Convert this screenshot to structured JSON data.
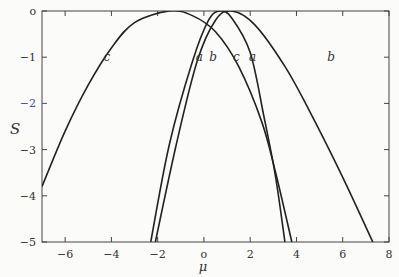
{
  "chart_data": {
    "type": "line",
    "title": "",
    "xlabel": "μ",
    "ylabel": "S",
    "xlim": [
      -7,
      8
    ],
    "ylim": [
      -5,
      0
    ],
    "x_ticks": [
      -6,
      -4,
      -2,
      0,
      2,
      4,
      6,
      8
    ],
    "x_tick_labels": [
      "−6",
      "−4",
      "−2",
      "o",
      "2",
      "4",
      "6",
      "8"
    ],
    "y_ticks": [
      0,
      -1,
      -2,
      -3,
      -4,
      -5
    ],
    "y_tick_labels": [
      "o",
      "−1",
      "−2",
      "−3",
      "−4",
      "−5"
    ],
    "highlight_tick_color": "#3b4bb0",
    "line_color": "#222222",
    "grid": false,
    "legend": "inline labels on curves",
    "series": [
      {
        "name": "a",
        "peak_mu": 0.7,
        "left_root_at_S-5": -2.3,
        "right_root_at_S-5": 3.5,
        "points": [
          [
            -2.3,
            -5
          ],
          [
            -1.5,
            -2.9
          ],
          [
            -0.5,
            -1.1
          ],
          [
            0.2,
            -0.2
          ],
          [
            0.7,
            0
          ],
          [
            1.2,
            -0.15
          ],
          [
            2.0,
            -0.9
          ],
          [
            2.6,
            -2.3
          ],
          [
            3.1,
            -3.6
          ],
          [
            3.5,
            -5
          ]
        ],
        "label_positions": [
          [
            -0.2,
            -1.0
          ],
          [
            2.1,
            -1.0
          ]
        ]
      },
      {
        "name": "b",
        "peak_mu": 1.2,
        "left_root_at_S-5": -2.1,
        "right_root_at_S-5": 7.3,
        "points": [
          [
            -2.1,
            -5
          ],
          [
            -1.2,
            -2.9
          ],
          [
            -0.3,
            -1.1
          ],
          [
            0.5,
            -0.2
          ],
          [
            1.2,
            0
          ],
          [
            2.2,
            -0.3
          ],
          [
            3.5,
            -1.2
          ],
          [
            4.6,
            -2.2
          ],
          [
            6.0,
            -3.6
          ],
          [
            7.3,
            -5
          ]
        ],
        "label_positions": [
          [
            0.4,
            -1.0
          ],
          [
            5.5,
            -1.0
          ]
        ]
      },
      {
        "name": "c",
        "peak_mu": -1.5,
        "left_root_at_S-5": null,
        "right_root_at_S-5": 3.8,
        "points": [
          [
            -7,
            -3.8
          ],
          [
            -6,
            -2.6
          ],
          [
            -5,
            -1.6
          ],
          [
            -4,
            -0.8
          ],
          [
            -3,
            -0.25
          ],
          [
            -1.5,
            0
          ],
          [
            -0.5,
            -0.1
          ],
          [
            0.5,
            -0.45
          ],
          [
            1.5,
            -1.2
          ],
          [
            2.5,
            -2.4
          ],
          [
            3.1,
            -3.5
          ],
          [
            3.8,
            -5
          ]
        ],
        "label_positions": [
          [
            -4.2,
            -1.0
          ],
          [
            1.4,
            -1.0
          ]
        ]
      }
    ]
  }
}
